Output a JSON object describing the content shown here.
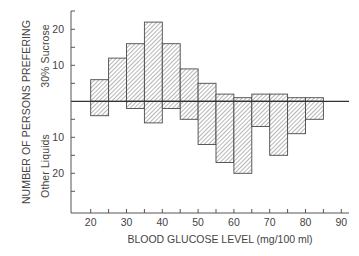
{
  "chart_data": {
    "type": "bar",
    "subtype": "diverging-histogram",
    "title": "",
    "xlabel": "BLOOD GLUCOSE LEVEL (mg/100 ml)",
    "ylabel": "NUMBER OF PERSONS PREFERING",
    "ylabel_upper": "30% Sucrose",
    "ylabel_lower": "Other Liquids",
    "xlim": [
      15,
      92
    ],
    "xticks": [
      20,
      30,
      40,
      50,
      60,
      70,
      80,
      90
    ],
    "xminor_ticks": [
      25,
      35,
      45,
      55,
      65,
      75,
      85
    ],
    "yticks_upper": [
      10,
      20
    ],
    "yticks_lower": [
      10,
      20
    ],
    "ylim_upper": 25,
    "ylim_lower": 30,
    "bin_width": 5,
    "bins": [
      20,
      25,
      30,
      35,
      40,
      45,
      50,
      55,
      60,
      65,
      70,
      75,
      80
    ],
    "series": [
      {
        "name": "30% Sucrose",
        "direction": "up",
        "values": [
          6,
          12,
          16,
          22,
          16,
          9,
          5,
          2,
          1,
          2,
          2,
          1,
          1
        ]
      },
      {
        "name": "Other Liquids",
        "direction": "down",
        "values": [
          4,
          0,
          2,
          6,
          2,
          5,
          12,
          17,
          20,
          7,
          15,
          9,
          5
        ]
      }
    ],
    "grid": false,
    "legend": "none",
    "colors": {
      "bar_outline": "#4a4a4a",
      "hatch": "#7a7a7a",
      "axis": "#555555"
    }
  }
}
